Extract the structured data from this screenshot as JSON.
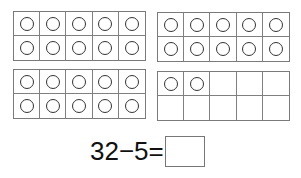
{
  "worksheet": {
    "ten_frames": [
      {
        "id": "frame-1",
        "counters": 10,
        "cells": 10
      },
      {
        "id": "frame-2",
        "counters": 10,
        "cells": 10
      },
      {
        "id": "frame-3",
        "counters": 10,
        "cells": 10
      },
      {
        "id": "frame-4",
        "counters": 2,
        "cells": 10
      }
    ],
    "total_counters": 32,
    "equation": {
      "text": "32−5=",
      "minuend": "32",
      "operator": "−",
      "subtrahend": "5",
      "equals": "=",
      "answer": ""
    }
  }
}
